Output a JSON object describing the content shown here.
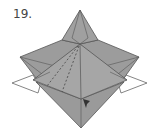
{
  "diagram": {
    "step_label": "19.",
    "colors": {
      "paper": "#9a9a9a",
      "paper_light": "#a8a8a8",
      "line": "#555555",
      "flap": "#ffffff",
      "arrow": "#333333"
    }
  }
}
